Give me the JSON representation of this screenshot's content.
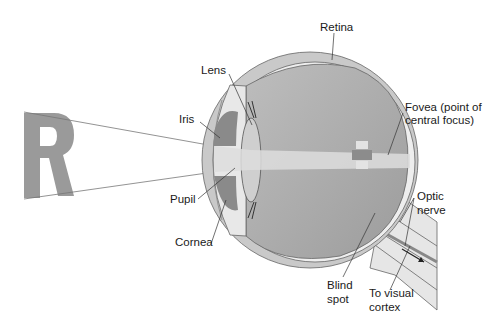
{
  "diagram": {
    "object_letter": "R",
    "labels": {
      "retina": "Retina",
      "lens": "Lens",
      "iris": "Iris",
      "fovea_line1": "Fovea (point of",
      "fovea_line2": "central focus)",
      "pupil": "Pupil",
      "cornea": "Cornea",
      "optic_line1": "Optic",
      "optic_line2": "nerve",
      "blind_line1": "Blind",
      "blind_line2": "spot",
      "cortex_line1": "To visual",
      "cortex_line2": "cortex"
    },
    "colors": {
      "letter": "#9a9a9a",
      "sclera": "#c9c9c9",
      "choroid": "#e6e6e6",
      "vitreous": "#a9a9a9",
      "iris": "#8a8a8a",
      "outline": "#555555"
    }
  }
}
